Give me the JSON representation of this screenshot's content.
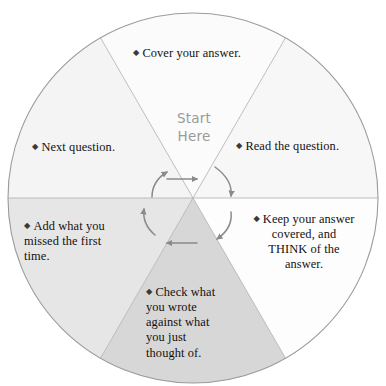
{
  "diagram": {
    "center_label": "Start\nHere",
    "center_label_color": "#9a9a9a",
    "outline_color": "#9b9b9b",
    "spoke_color": "#b4b4b4",
    "arrow_color": "#8c8a88",
    "text_color": "#14110f",
    "bullet_glyph": "◆",
    "segments": [
      {
        "id": "cover-your-answer",
        "position": "top",
        "order": 1,
        "text": "Cover your answer.",
        "fill": "#fbfbfb",
        "start_angle_deg": -120,
        "end_angle_deg": -60
      },
      {
        "id": "read-the-question",
        "position": "upper-right",
        "order": 2,
        "text": "Read the question.",
        "fill": "#f7f7f7",
        "start_angle_deg": -60,
        "end_angle_deg": 0
      },
      {
        "id": "keep-answer-covered-think",
        "position": "lower-right",
        "order": 3,
        "text": "Keep your answer\ncovered, and\nTHINK of the\nanswer.",
        "fill": "#fdfdfd",
        "start_angle_deg": 0,
        "end_angle_deg": 60
      },
      {
        "id": "check-what-you-wrote",
        "position": "bottom",
        "order": 4,
        "text": "Check what\nyou wrote\nagainst what\nyou just\nthought of.",
        "fill": "#d7d7d7",
        "start_angle_deg": 60,
        "end_angle_deg": 120
      },
      {
        "id": "add-what-you-missed",
        "position": "lower-left",
        "order": 5,
        "text": "Add what you\nmissed the first\ntime.",
        "fill": "#e6e6e6",
        "start_angle_deg": 120,
        "end_angle_deg": 180
      },
      {
        "id": "next-question",
        "position": "upper-left",
        "order": 6,
        "text": "Next question.",
        "fill": "#f4f4f4",
        "start_angle_deg": 180,
        "end_angle_deg": 240
      }
    ],
    "arrows": [
      {
        "id": "arrow-start-to-read",
        "shape": "straight",
        "direction": "right"
      },
      {
        "id": "arrow-read-to-keep",
        "shape": "curved",
        "direction": "clockwise-down-right"
      },
      {
        "id": "arrow-keep-to-check",
        "shape": "curved",
        "direction": "clockwise-down"
      },
      {
        "id": "arrow-check-to-add",
        "shape": "straight",
        "direction": "left"
      },
      {
        "id": "arrow-add-to-next",
        "shape": "curved",
        "direction": "clockwise-up-left"
      },
      {
        "id": "arrow-next-to-cover",
        "shape": "curved",
        "direction": "clockwise-up"
      }
    ]
  }
}
